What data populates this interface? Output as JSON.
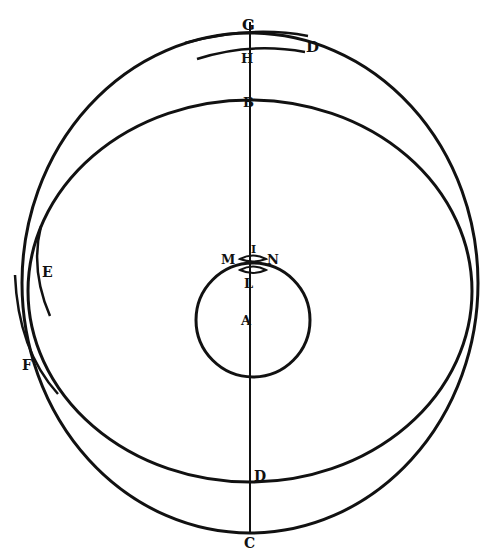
{
  "diagram": {
    "title": "",
    "stroke_color": "#111111",
    "background": "#ffffff",
    "labels": {
      "G": "G",
      "H": "H",
      "D_top": "D",
      "B": "B",
      "I": "I",
      "M": "M",
      "N": "N",
      "L": "L",
      "A": "A",
      "E": "E",
      "F": "F",
      "D_bottom": "D",
      "C": "C"
    }
  }
}
